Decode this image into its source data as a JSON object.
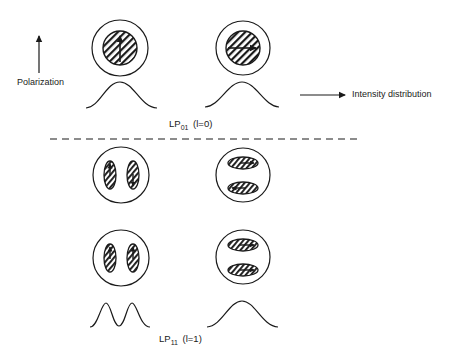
{
  "legend": {
    "polarization_label": "Polarization",
    "intensity_label": "Intensity distribution"
  },
  "modes": [
    {
      "name": "LP",
      "subscript": "01",
      "param": "(l=0)",
      "polarization_states": [
        {
          "lobes": 1,
          "field_direction": "up",
          "profile": "single-peak"
        },
        {
          "lobes": 1,
          "field_direction": "right",
          "profile": "single-peak"
        }
      ]
    },
    {
      "name": "LP",
      "subscript": "11",
      "param": "(l=1)",
      "polarization_states": [
        {
          "lobes": 2,
          "orientation": "side-by-side",
          "field_direction": [
            "up",
            "down"
          ]
        },
        {
          "lobes": 2,
          "orientation": "stacked",
          "field_direction": [
            "right",
            "left"
          ]
        },
        {
          "lobes": 2,
          "orientation": "side-by-side",
          "field_direction": [
            "up",
            "up"
          ],
          "profile": "double-peak"
        },
        {
          "lobes": 2,
          "orientation": "stacked",
          "field_direction": [
            "right",
            "right"
          ],
          "profile": "single-peak"
        }
      ]
    }
  ],
  "colors": {
    "ink": "#1a1a1a",
    "background": "#ffffff"
  }
}
